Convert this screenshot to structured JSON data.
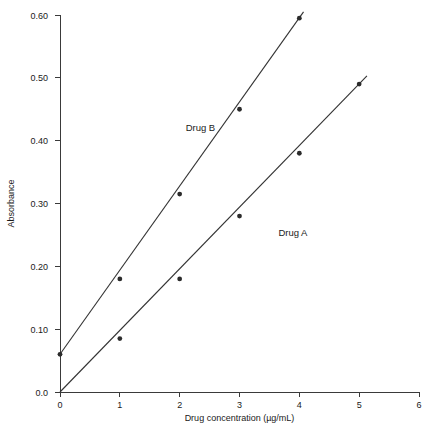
{
  "chart_data": {
    "type": "line",
    "title": "",
    "xlabel": "Drug concentration (µg/mL)",
    "ylabel": "Absorbance",
    "xlim": [
      0,
      6
    ],
    "ylim": [
      0.0,
      0.6
    ],
    "grid": false,
    "legend_position": "inline-annotation",
    "xticks": [
      0,
      1,
      2,
      3,
      4,
      5,
      6
    ],
    "xtick_labels": [
      "0",
      "1",
      "2",
      "3",
      "4",
      "5",
      "6"
    ],
    "yticks": [
      0.0,
      0.1,
      0.2,
      0.3,
      0.4,
      0.5,
      0.6
    ],
    "ytick_labels": [
      "0.0",
      "0.10",
      "0.20",
      "0.30",
      "0.40",
      "0.50",
      "0.60"
    ],
    "series": [
      {
        "name": "Drug B",
        "label_x": 2.1,
        "label_y": 0.415,
        "x": [
          0,
          1,
          2,
          3,
          4
        ],
        "y": [
          0.06,
          0.18,
          0.315,
          0.45,
          0.595
        ],
        "line_from": [
          0,
          0.06
        ],
        "line_to": [
          4.07,
          0.605
        ]
      },
      {
        "name": "Drug A",
        "label_x": 3.65,
        "label_y": 0.248,
        "x": [
          0,
          1,
          2,
          3,
          4,
          5
        ],
        "y": [
          0.0,
          0.085,
          0.18,
          0.28,
          0.38,
          0.49
        ],
        "line_from": [
          0,
          0.0
        ],
        "line_to": [
          5.13,
          0.503
        ]
      }
    ],
    "annotations": [
      {
        "name": "drug-b-label",
        "text": "Drug B"
      },
      {
        "name": "drug-a-label",
        "text": "Drug A"
      }
    ],
    "caption": ""
  },
  "figure": {
    "background_color": "#ffffff",
    "axis_color": "#3a3a3a",
    "series_color": "#333333",
    "marker_color": "#2b2b2b"
  }
}
